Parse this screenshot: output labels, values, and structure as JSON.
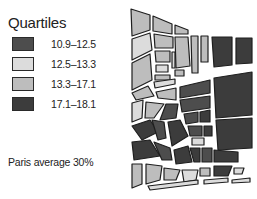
{
  "legend": {
    "title": "Quartiles",
    "items": [
      {
        "label": "10.9–12.5",
        "color": "#4d4d4d"
      },
      {
        "label": "12.5–13.3",
        "color": "#dcdcdc"
      },
      {
        "label": "13.3–17.1",
        "color": "#bdbdbd"
      },
      {
        "label": "17.1–18.1",
        "color": "#3c3c3c"
      }
    ]
  },
  "note": "Paris average 30%",
  "map": {
    "type": "choropleth",
    "outline_color": "#1e1e1e",
    "background": "#ffffff"
  }
}
